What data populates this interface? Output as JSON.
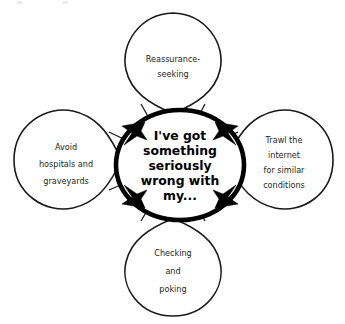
{
  "diagram": {
    "type": "cycle",
    "center": {
      "label": "I've got something seriously wrong with my...",
      "lines": [
        "I've got",
        "something",
        "seriously",
        "wrong with",
        "my..."
      ]
    },
    "nodes": [
      {
        "id": "reassurance-seeking",
        "position": "top",
        "label": "Reassurance-seeking",
        "lines": [
          "Reassurance-",
          "seeking"
        ]
      },
      {
        "id": "trawl-internet",
        "position": "right",
        "label": "Trawl the internet for similar conditions",
        "lines": [
          "Trawl the",
          "internet",
          "for similar",
          "conditions"
        ]
      },
      {
        "id": "checking-and-poking",
        "position": "bottom",
        "label": "Checking and poking",
        "lines": [
          "Checking",
          "and",
          "poking"
        ]
      },
      {
        "id": "avoid-hospitals",
        "position": "left",
        "label": "Avoid hospitals and graveyards",
        "lines": [
          "Avoid",
          "hospitals and",
          "graveyards"
        ]
      }
    ],
    "arrows": [
      {
        "id": "arrow-top-left",
        "direction": "clockwise"
      },
      {
        "id": "arrow-top-right",
        "direction": "clockwise"
      },
      {
        "id": "arrow-bottom-right",
        "direction": "clockwise"
      },
      {
        "id": "arrow-bottom-left",
        "direction": "clockwise"
      }
    ],
    "colors": {
      "stroke": "#1a1a1a",
      "core_stroke": "#000000",
      "fill": "#ffffff",
      "text": "#231f20",
      "arrow": "#000000"
    }
  }
}
